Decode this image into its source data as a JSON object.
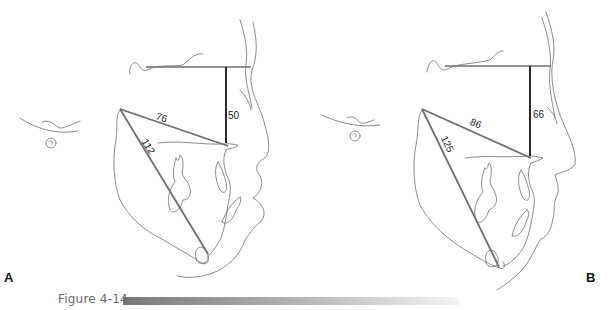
{
  "figure": {
    "caption": "Figure 4-14",
    "caption_bar_gradient": [
      "#777777",
      "#f4f4f4"
    ]
  },
  "panels": [
    {
      "letter": "A",
      "measurements": {
        "vertical": "50",
        "upper_diagonal": "76",
        "lower_diagonal": "112"
      }
    },
    {
      "letter": "B",
      "measurements": {
        "vertical": "66",
        "upper_diagonal": "86",
        "lower_diagonal": "125"
      }
    }
  ],
  "colors": {
    "outline": "#6f6f6f",
    "measure_gray": "#6e6e6e",
    "measure_black": "#111111"
  }
}
